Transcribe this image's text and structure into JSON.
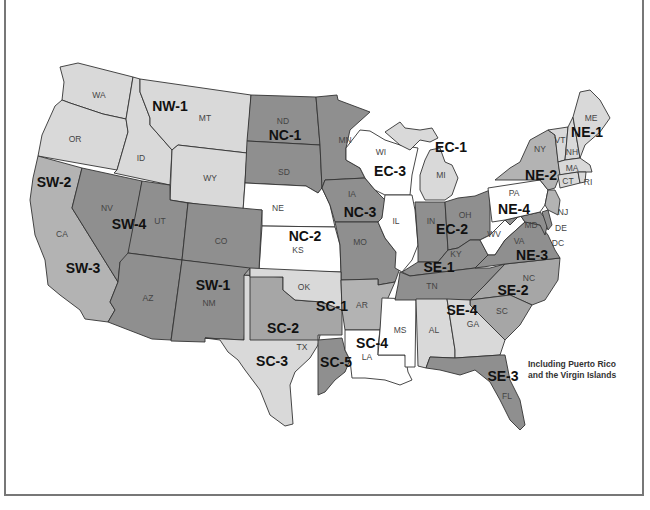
{
  "map": {
    "colors": {
      "white": "#ffffff",
      "light": "#d9d9d9",
      "medium": "#b3b3b3",
      "dark": "#8f8f8f",
      "border": "#333333",
      "frame": "#777777"
    },
    "states": [
      {
        "abbr": "WA",
        "region": "NW-1",
        "shade": "light"
      },
      {
        "abbr": "OR",
        "region": "NW-1",
        "shade": "light"
      },
      {
        "abbr": "ID",
        "region": "NW-1",
        "shade": "light"
      },
      {
        "abbr": "MT",
        "region": "NW-1",
        "shade": "light"
      },
      {
        "abbr": "WY",
        "region": "NW-1",
        "shade": "light"
      },
      {
        "abbr": "ND",
        "region": "NC-1",
        "shade": "dark"
      },
      {
        "abbr": "SD",
        "region": "NC-1",
        "shade": "dark"
      },
      {
        "abbr": "MN",
        "region": "NC-1",
        "shade": "dark"
      },
      {
        "abbr": "NE",
        "region": "NC-2",
        "shade": "white"
      },
      {
        "abbr": "KS",
        "region": "NC-2",
        "shade": "white"
      },
      {
        "abbr": "IA",
        "region": "NC-3",
        "shade": "dark"
      },
      {
        "abbr": "MO",
        "region": "NC-3",
        "shade": "dark"
      },
      {
        "abbr": "CA",
        "region": "SW-2 / SW-3",
        "shade": "medium"
      },
      {
        "abbr": "NV",
        "region": "SW-4",
        "shade": "dark"
      },
      {
        "abbr": "UT",
        "region": "SW-4",
        "shade": "dark"
      },
      {
        "abbr": "CO",
        "region": "SW-1",
        "shade": "dark"
      },
      {
        "abbr": "AZ",
        "region": "SW-1",
        "shade": "dark"
      },
      {
        "abbr": "NM",
        "region": "SW-1",
        "shade": "dark"
      },
      {
        "abbr": "OK",
        "region": "SC-1",
        "shade": "light"
      },
      {
        "abbr": "AR",
        "region": "SC-1",
        "shade": "medium"
      },
      {
        "abbr": "TX",
        "region": "SC-2 / SC-3 / SC-5",
        "shade": "light"
      },
      {
        "abbr": "LA",
        "region": "SC-4",
        "shade": "white"
      },
      {
        "abbr": "MS",
        "region": "SC-4",
        "shade": "white"
      },
      {
        "abbr": "WI",
        "region": "EC-3",
        "shade": "white"
      },
      {
        "abbr": "IL",
        "region": "EC-3",
        "shade": "white"
      },
      {
        "abbr": "MI",
        "region": "EC-1",
        "shade": "light"
      },
      {
        "abbr": "IN",
        "region": "EC-2",
        "shade": "dark"
      },
      {
        "abbr": "OH",
        "region": "EC-2",
        "shade": "dark"
      },
      {
        "abbr": "KY",
        "region": "SE-1",
        "shade": "dark"
      },
      {
        "abbr": "TN",
        "region": "SE-1",
        "shade": "dark"
      },
      {
        "abbr": "NC",
        "region": "SE-2",
        "shade": "medium"
      },
      {
        "abbr": "SC",
        "region": "SE-2",
        "shade": "medium"
      },
      {
        "abbr": "FL",
        "region": "SE-3",
        "shade": "medium"
      },
      {
        "abbr": "AL",
        "region": "SE-4",
        "shade": "light"
      },
      {
        "abbr": "GA",
        "region": "SE-4",
        "shade": "light"
      },
      {
        "abbr": "VA",
        "region": "NE-3",
        "shade": "dark"
      },
      {
        "abbr": "WV",
        "region": "NE-3",
        "shade": "white"
      },
      {
        "abbr": "MD",
        "region": "NE-3",
        "shade": "dark"
      },
      {
        "abbr": "DE",
        "region": "NE-3",
        "shade": "dark"
      },
      {
        "abbr": "DC",
        "region": "NE-3",
        "shade": "dark"
      },
      {
        "abbr": "PA",
        "region": "NE-4",
        "shade": "white"
      },
      {
        "abbr": "NY",
        "region": "NE-2",
        "shade": "medium"
      },
      {
        "abbr": "NJ",
        "region": "NE-2",
        "shade": "medium"
      },
      {
        "abbr": "CT",
        "region": "NE-1",
        "shade": "light"
      },
      {
        "abbr": "RI",
        "region": "NE-1",
        "shade": "light"
      },
      {
        "abbr": "MA",
        "region": "NE-1",
        "shade": "light"
      },
      {
        "abbr": "VT",
        "region": "NE-1",
        "shade": "light"
      },
      {
        "abbr": "NH",
        "region": "NE-1",
        "shade": "light"
      },
      {
        "abbr": "ME",
        "region": "NE-1",
        "shade": "light"
      }
    ],
    "state_labels": {
      "WA": "WA",
      "OR": "OR",
      "ID": "ID",
      "MT": "MT",
      "WY": "WY",
      "ND": "ND",
      "SD": "SD",
      "MN": "MN",
      "NE": "NE",
      "KS": "KS",
      "IA": "IA",
      "MO": "MO",
      "CA": "CA",
      "NV": "NV",
      "UT": "UT",
      "CO": "CO",
      "AZ": "AZ",
      "NM": "NM",
      "OK": "OK",
      "AR": "AR",
      "TX": "TX",
      "LA": "LA",
      "MS": "MS",
      "WI": "WI",
      "IL": "IL",
      "MI": "MI",
      "IN": "IN",
      "OH": "OH",
      "KY": "KY",
      "TN": "TN",
      "NC": "NC",
      "SC": "SC",
      "FL": "FL",
      "AL": "AL",
      "GA": "GA",
      "VA": "VA",
      "WV": "WV",
      "MD": "MD",
      "DE": "DE",
      "DC": "DC",
      "PA": "PA",
      "NY": "NY",
      "NJ": "NJ",
      "CT": "CT",
      "RI": "RI",
      "MA": "MA",
      "VT": "VT",
      "NH": "NH",
      "ME": "ME"
    },
    "region_labels": {
      "NW1": "NW-1",
      "NC1": "NC-1",
      "NC2": "NC-2",
      "NC3": "NC-3",
      "SW1": "SW-1",
      "SW2": "SW-2",
      "SW3": "SW-3",
      "SW4": "SW-4",
      "SC1": "SC-1",
      "SC2": "SC-2",
      "SC3": "SC-3",
      "SC4": "SC-4",
      "SC5": "SC-5",
      "EC1": "EC-1",
      "EC2": "EC-2",
      "EC3": "EC-3",
      "SE1": "SE-1",
      "SE2": "SE-2",
      "SE3": "SE-3",
      "SE4": "SE-4",
      "NE1": "NE-1",
      "NE2": "NE-2",
      "NE3": "NE-3",
      "NE4": "NE-4"
    },
    "note": "Including Puerto Rico\nand the Virgin Islands"
  }
}
